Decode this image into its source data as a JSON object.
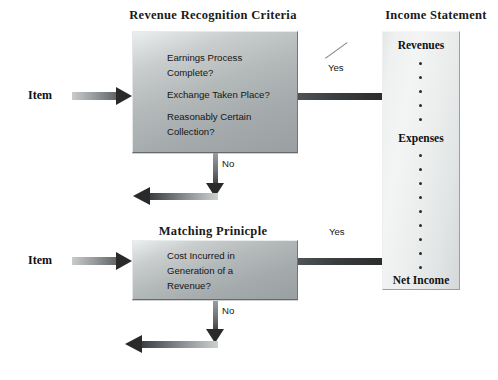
{
  "diagram": {
    "title_revenue": "Revenue Recognition Criteria",
    "title_matching": "Matching Prinicple",
    "title_income": "Income Statement",
    "inputs": {
      "item_top": "Item",
      "item_bottom": "Item"
    },
    "revenue_box": {
      "lines": [
        "Earnings Process",
        "Complete?",
        "Exchange Taken Place?",
        "Reasonably Certain",
        "Collection?"
      ]
    },
    "matching_box": {
      "lines": [
        "Cost Incurred in",
        "Generation of  a",
        "Revenue?"
      ]
    },
    "income_statement": {
      "items": [
        "Revenues",
        "Expenses",
        "Net Income"
      ],
      "dots_between_revenues_expenses": 5,
      "dots_between_expenses_netincome": 10
    },
    "edges": {
      "yes_top": "Yes",
      "no_top": "No",
      "yes_bottom": "Yes",
      "no_bottom": "No"
    },
    "colors": {
      "box_fill_light": "#eceff0",
      "box_fill_dark": "#9aa0a1",
      "column_fill": "#f3f4f4",
      "arrow_dark": "#2a2a2a",
      "arrow_light": "#b9bcbd",
      "text": "#151515",
      "background": "#ffffff"
    }
  }
}
